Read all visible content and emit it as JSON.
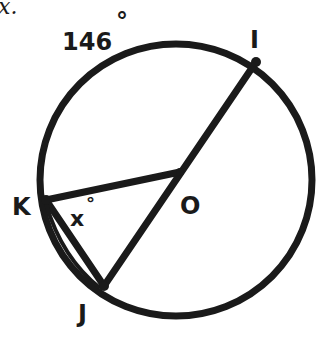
{
  "diagram": {
    "partial_text": "x.",
    "arc_label": "146",
    "arc_degree_symbol": "°",
    "angle_label": "x",
    "angle_degree_symbol": "°",
    "points": {
      "I": "I",
      "K": "K",
      "O": "O",
      "J": "J"
    },
    "colors": {
      "stroke": "#1a1a1a",
      "background": "#ffffff"
    }
  }
}
